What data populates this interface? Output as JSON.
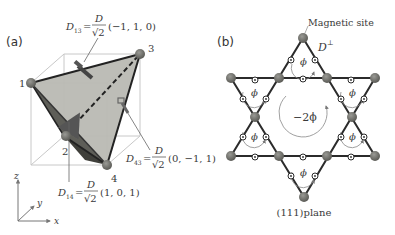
{
  "panel_a": {
    "label": "(a)",
    "vertices": [
      {
        "id": "1",
        "label": "1"
      },
      {
        "id": "2",
        "label": "2"
      },
      {
        "id": "3",
        "label": "3"
      },
      {
        "id": "4",
        "label": "4"
      }
    ],
    "dm_vectors": {
      "d13": {
        "sym": "D",
        "sub": "13",
        "eq": "=",
        "num": "D",
        "den": "√2",
        "vec": "(−1, 1, 0)"
      },
      "d14": {
        "sym": "D",
        "sub": "14",
        "eq": "=",
        "num": "D",
        "den": "√2",
        "vec": "(1, 0, 1)"
      },
      "d43": {
        "sym": "D",
        "sub": "43",
        "eq": "=",
        "num": "D",
        "den": "√2",
        "vec": "(0, −1, 1)"
      }
    },
    "axes": {
      "x": "x",
      "y": "y",
      "z": "z"
    }
  },
  "panel_b": {
    "label": "(b)",
    "magnetic_site_label": "Magnetic site",
    "d_perp": {
      "sym": "D",
      "sup": "⊥"
    },
    "small_flux": "ϕ",
    "center_flux": "−2ϕ",
    "plane_label": "(111)plane"
  },
  "colors": {
    "tetra_face": "#b9b9b3",
    "tetra_dark": "#5a5a55",
    "node": "#6b6b66",
    "edge": "#2b2b2b",
    "cube": "#c8c8c8"
  }
}
